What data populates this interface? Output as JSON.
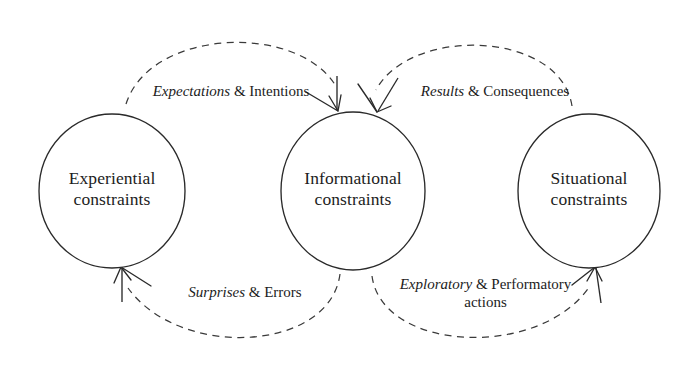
{
  "diagram": {
    "background_color": "#ffffff",
    "stroke_color": "#2a2a2a",
    "dash_color": "#3a3a3a",
    "nodes": [
      {
        "id": "experiential",
        "line1": "Experiential",
        "line2": "constraints"
      },
      {
        "id": "informational",
        "line1": "Informational",
        "line2": "constraints"
      },
      {
        "id": "situational",
        "line1": "Situational",
        "line2": "constraints"
      }
    ],
    "edges": [
      {
        "id": "expectations",
        "emphasis": "Expectations",
        "amp": "&",
        "rest": "Intentions",
        "line2": "",
        "from": "experiential",
        "to": "informational",
        "position": "top-left"
      },
      {
        "id": "results",
        "emphasis": "Results",
        "amp": "&",
        "rest": "Consequences",
        "line2": "",
        "from": "situational",
        "to": "informational",
        "position": "top-right"
      },
      {
        "id": "surprises",
        "emphasis": "Surprises",
        "amp": "&",
        "rest": "Errors",
        "line2": "",
        "from": "informational",
        "to": "experiential",
        "position": "bottom-left"
      },
      {
        "id": "exploratory",
        "emphasis": "Exploratory",
        "amp": "&",
        "rest": "Performatory",
        "line2": "actions",
        "from": "informational",
        "to": "situational",
        "position": "bottom-right"
      }
    ]
  }
}
